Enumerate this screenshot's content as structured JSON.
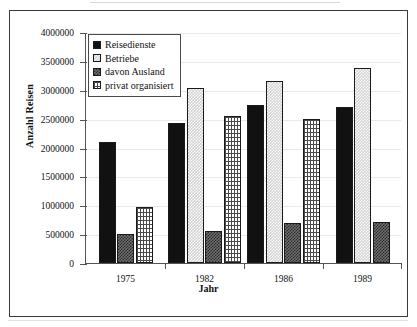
{
  "chart_data": {
    "type": "bar",
    "title": "",
    "xlabel": "Jahr",
    "ylabel": "Anzahl Reisen",
    "categories": [
      "1975",
      "1982",
      "1986",
      "1989"
    ],
    "ylim": [
      0,
      4000000
    ],
    "ytick_labels": [
      "0",
      "500000",
      "1000000",
      "1500000",
      "2000000",
      "2500000",
      "3000000",
      "3500000",
      "4000000"
    ],
    "ytick_values": [
      0,
      500000,
      1000000,
      1500000,
      2000000,
      2500000,
      3000000,
      3500000,
      4000000
    ],
    "grid": true,
    "legend_position": "top-left-inside",
    "series": [
      {
        "name": "Reisedienste",
        "pattern": "solid-black",
        "color": "#111111",
        "values": [
          2100000,
          2420000,
          2730000,
          2700000
        ]
      },
      {
        "name": "Betriebe",
        "pattern": "light-dither",
        "color": "#d3d3d3",
        "values": [
          null,
          3030000,
          3160000,
          3370000
        ]
      },
      {
        "name": "davon Ausland",
        "pattern": "dark-checker",
        "color": "#6e6e6e",
        "values": [
          500000,
          550000,
          700000,
          710000
        ]
      },
      {
        "name": "privat organisiert",
        "pattern": "brick",
        "color": "#ffffff",
        "values": [
          970000,
          2550000,
          2500000,
          null
        ]
      }
    ]
  },
  "legend": {
    "items": [
      {
        "label": "Reisedienste"
      },
      {
        "label": "Betriebe"
      },
      {
        "label": "davon Ausland"
      },
      {
        "label": "privat organisiert"
      }
    ]
  },
  "axes": {
    "y_title": "Anzahl Reisen",
    "x_title": "Jahr"
  }
}
